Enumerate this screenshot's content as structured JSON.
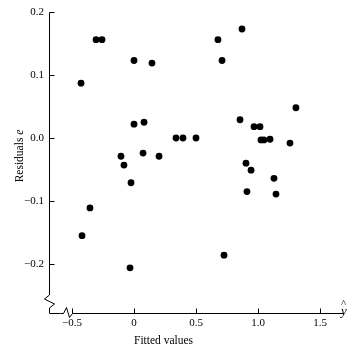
{
  "chart_data": {
    "type": "scatter",
    "title": "",
    "xlabel": "Fitted values",
    "ylabel": "Residuals e",
    "xaxis_symbol": "y",
    "xaxis_symbol_accent": "^",
    "xlim": [
      -0.62,
      1.72
    ],
    "ylim": [
      -0.24,
      0.205
    ],
    "grid": false,
    "legend": null,
    "xticks": [
      -0.5,
      0,
      0.5,
      1.0,
      1.5
    ],
    "xticklabels": [
      "−0.5",
      "0",
      "0.5",
      "1.0",
      "1.5"
    ],
    "yticks": [
      -0.2,
      -0.1,
      0.0,
      0.1,
      0.2
    ],
    "yticklabels": [
      "−0.2",
      "−0.1",
      "0.0",
      "0.1",
      "0.2"
    ],
    "axis_break_x": true,
    "axis_break_y": true,
    "marker": "filled-circle",
    "marker_color": "#000000",
    "marker_size": 3.4,
    "n_points": 35,
    "points": [
      {
        "x": -0.427,
        "y": 0.087
      },
      {
        "x": -0.306,
        "y": 0.156
      },
      {
        "x": -0.258,
        "y": 0.156
      },
      {
        "x": -0.105,
        "y": -0.029
      },
      {
        "x": -0.081,
        "y": -0.043
      },
      {
        "x": 0.0,
        "y": 0.123
      },
      {
        "x": 0.0,
        "y": 0.022
      },
      {
        "x": -0.024,
        "y": -0.071
      },
      {
        "x": 0.081,
        "y": 0.025
      },
      {
        "x": 0.073,
        "y": -0.024
      },
      {
        "x": 0.145,
        "y": 0.119
      },
      {
        "x": 0.202,
        "y": -0.029
      },
      {
        "x": -0.355,
        "y": -0.111
      },
      {
        "x": -0.419,
        "y": -0.155
      },
      {
        "x": -0.032,
        "y": -0.206
      },
      {
        "x": 0.677,
        "y": 0.156
      },
      {
        "x": 0.71,
        "y": 0.123
      },
      {
        "x": 0.726,
        "y": -0.186
      },
      {
        "x": 0.871,
        "y": 0.173
      },
      {
        "x": 0.855,
        "y": 0.029
      },
      {
        "x": 0.903,
        "y": -0.04
      },
      {
        "x": 0.944,
        "y": -0.051
      },
      {
        "x": 0.911,
        "y": -0.085
      },
      {
        "x": 0.968,
        "y": 0.018
      },
      {
        "x": 1.016,
        "y": 0.018
      },
      {
        "x": 1.024,
        "y": -0.003
      },
      {
        "x": 1.097,
        "y": -0.002
      },
      {
        "x": 1.129,
        "y": -0.064
      },
      {
        "x": 1.145,
        "y": -0.089
      },
      {
        "x": 1.258,
        "y": -0.008
      },
      {
        "x": 1.306,
        "y": 0.048
      },
      {
        "x": 1.048,
        "y": -0.003
      },
      {
        "x": 0.339,
        "y": 0.0
      },
      {
        "x": 0.395,
        "y": 0.0
      },
      {
        "x": 0.5,
        "y": 0.0
      }
    ]
  },
  "axes": {
    "y_axis_name": "residuals-axis",
    "x_axis_name": "fitted-values-axis"
  }
}
